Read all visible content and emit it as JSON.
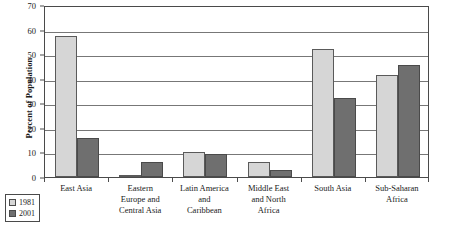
{
  "chart_data": {
    "type": "bar",
    "title": "",
    "xlabel": "",
    "ylabel": "Percent of Population",
    "ylim": [
      0,
      70
    ],
    "yticks": [
      0,
      10,
      20,
      30,
      40,
      50,
      60,
      70
    ],
    "grid": true,
    "legend_position": "bottom-left",
    "categories": [
      "East Asia",
      "Eastern Europe and Central Asia",
      "Latin America and Caribbean",
      "Middle East and North Africa",
      "South Asia",
      "Sub-Saharan Africa"
    ],
    "category_lines": [
      [
        "East Asia"
      ],
      [
        "Eastern",
        "Europe and",
        "Central Asia"
      ],
      [
        "Latin America",
        "and",
        "Caribbean"
      ],
      [
        "Middle East",
        "and North",
        "Africa"
      ],
      [
        "South Asia"
      ],
      [
        "Sub-Saharan",
        "Africa"
      ]
    ],
    "series": [
      {
        "name": "1981",
        "color": "#d6d6d6",
        "values": [
          57.5,
          1.0,
          10.0,
          6.0,
          52.0,
          41.5
        ]
      },
      {
        "name": "2001",
        "color": "#6f6f6f",
        "values": [
          16.0,
          6.0,
          9.5,
          3.0,
          32.0,
          45.5
        ]
      }
    ]
  },
  "legend": {
    "items": [
      {
        "label": "1981",
        "swatch": "light-gray"
      },
      {
        "label": "2001",
        "swatch": "dark-gray"
      }
    ]
  },
  "axis": {
    "y_title": "Percent of Population"
  }
}
